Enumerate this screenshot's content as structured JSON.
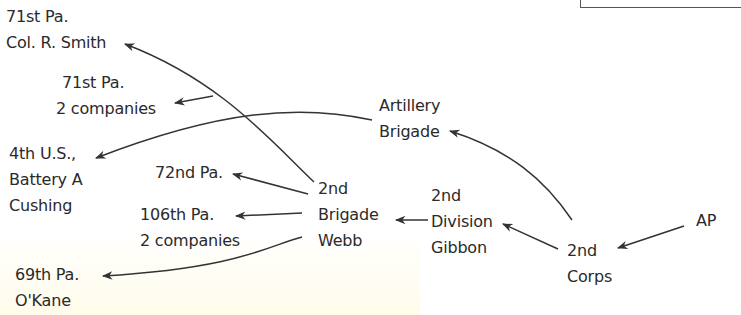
{
  "nodes": {
    "smith": {
      "line1": "71st Pa.",
      "line2": "Col. R. Smith"
    },
    "pa71_2co": {
      "line1": "71st Pa.",
      "line2": "2 companies"
    },
    "cushing": {
      "line1": "4th U.S.,",
      "line2": "Battery A",
      "line3": "Cushing"
    },
    "pa72": {
      "line1": "72nd Pa."
    },
    "pa106": {
      "line1": "106th Pa.",
      "line2": "2 companies"
    },
    "okane": {
      "line1": "69th Pa.",
      "line2": "O'Kane"
    },
    "webb": {
      "line1": "2nd",
      "line2": "Brigade",
      "line3": "Webb"
    },
    "artillery": {
      "line1": "Artillery",
      "line2": "Brigade"
    },
    "gibbon": {
      "line1": "2nd",
      "line2": "Division",
      "line3": "Gibbon"
    },
    "corps": {
      "line1": "2nd",
      "line2": "Corps"
    },
    "ap": {
      "line1": "AP"
    }
  },
  "edges": [
    {
      "from": "AP",
      "to": "2nd Corps"
    },
    {
      "from": "2nd Corps",
      "to": "2nd Division Gibbon"
    },
    {
      "from": "2nd Corps",
      "to": "Artillery Brigade"
    },
    {
      "from": "2nd Division Gibbon",
      "to": "2nd Brigade Webb"
    },
    {
      "from": "Artillery Brigade",
      "to": "4th U.S., Battery A Cushing"
    },
    {
      "from": "2nd Brigade Webb",
      "to": "71st Pa. Col. R. Smith"
    },
    {
      "from": "2nd Brigade Webb",
      "to": "71st Pa. 2 companies"
    },
    {
      "from": "2nd Brigade Webb",
      "to": "72nd Pa."
    },
    {
      "from": "2nd Brigade Webb",
      "to": "106th Pa. 2 companies"
    },
    {
      "from": "2nd Brigade Webb",
      "to": "69th Pa. O'Kane"
    }
  ],
  "colors": {
    "ink": "#2a2a2a",
    "line": "#333333"
  }
}
